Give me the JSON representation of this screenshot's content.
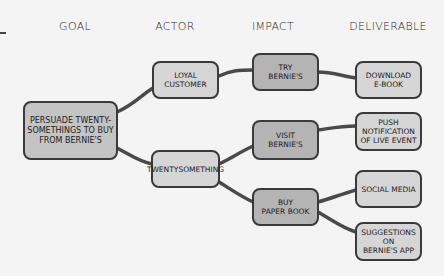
{
  "columns": {
    "goal": "GOAL",
    "actor": "ACTOR",
    "impact": "IMPACT",
    "deliverable": "DELIVERABLE"
  },
  "nodes": {
    "goal": "PERSUADE TWENTY-\nSOMETHINGS TO BUY\nFROM BERNIE'S",
    "loyal_customer": "LOYAL\nCUSTOMER",
    "twentysomething": "TWENTYSOMETHING",
    "try_bernies": "TRY\nBERNIE'S",
    "visit_bernies": "VISIT\nBERNIE'S",
    "buy_paper_book": "BUY\nPAPER BOOK",
    "download_ebook": "DOWNLOAD\nE-BOOK",
    "push_notification": "PUSH\nNOTIFICATION\nOF LIVE EVENT",
    "social_media": "SOCIAL MEDIA",
    "suggestions": "SUGGESTIONS\nON\nBERNIE'S APP"
  },
  "colors": {
    "background": "#f4f4f4",
    "node_fill": "#c4c4c4",
    "node_border": "#3a3a3a",
    "link": "#4a4a4a"
  }
}
